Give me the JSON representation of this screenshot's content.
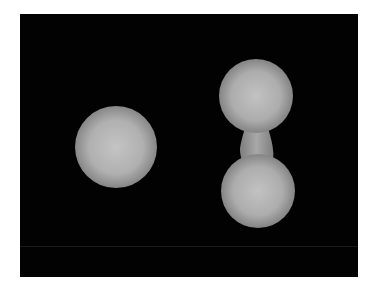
{
  "scene": {
    "background_color": "#020202",
    "objects": [
      {
        "name": "sphere",
        "shape": "sphere",
        "color": "#b8b8b8"
      },
      {
        "name": "dumbbell",
        "shape": "fused-spheres",
        "color": "#b8b8b8"
      }
    ]
  }
}
